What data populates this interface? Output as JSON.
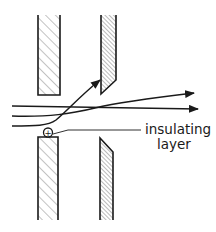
{
  "diagram": {
    "type": "electrode-aperture-schematic",
    "colors": {
      "stroke": "#1a1a1a",
      "background": "#ffffff",
      "hatch": "#555555"
    },
    "plates": [
      {
        "id": "upper-left-plate",
        "hatched": true
      },
      {
        "id": "upper-right-plate",
        "hatched": true,
        "bevel": "bottom"
      },
      {
        "id": "lower-left-plate",
        "hatched": true
      },
      {
        "id": "lower-right-plate",
        "hatched": true,
        "bevel": "top"
      }
    ],
    "beams": [
      {
        "id": "straight-beam",
        "arrow": true
      },
      {
        "id": "deflected-beam",
        "arrow": true
      },
      {
        "id": "strongly-deflected-beam",
        "arrow": true,
        "terminates_on": "upper-right-plate"
      }
    ],
    "charge_symbol": "+",
    "annotation": {
      "line1": "insulating",
      "line2": "layer"
    }
  }
}
